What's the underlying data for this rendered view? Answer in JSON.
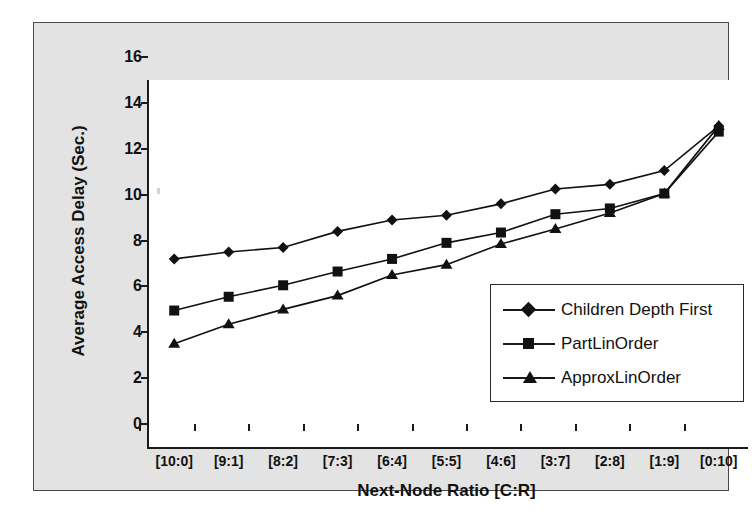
{
  "chart_data": {
    "type": "line",
    "title": "",
    "xlabel": "Next-Node Ratio [C:R]",
    "ylabel": "Average Access Delay (Sec.)",
    "categories": [
      "[10:0]",
      "[9:1]",
      "[8:2]",
      "[7:3]",
      "[6:4]",
      "[5:5]",
      "[4:6]",
      "[3:7]",
      "[2:8]",
      "[1:9]",
      "[0:10]"
    ],
    "yticks": [
      0,
      2,
      4,
      6,
      8,
      10,
      12,
      14,
      16
    ],
    "ylim": [
      0,
      16
    ],
    "grid": false,
    "legend_position": "inside-lower-right",
    "series": [
      {
        "name": "Children Depth First",
        "marker": "diamond",
        "color": "#111111",
        "values": [
          8.2,
          8.5,
          8.7,
          9.4,
          9.9,
          10.1,
          10.6,
          11.25,
          11.45,
          12.05,
          14.0
        ]
      },
      {
        "name": "PartLinOrder",
        "marker": "square",
        "color": "#111111",
        "values": [
          5.95,
          6.55,
          7.05,
          7.65,
          8.2,
          8.9,
          9.35,
          10.15,
          10.4,
          11.05,
          13.75
        ]
      },
      {
        "name": "ApproxLinOrder",
        "marker": "triangle",
        "color": "#111111",
        "values": [
          4.5,
          5.35,
          6.0,
          6.6,
          7.5,
          7.95,
          8.85,
          9.5,
          10.2,
          11.05,
          14.0
        ]
      }
    ]
  },
  "legend": {
    "items": [
      {
        "label": "Children Depth First",
        "marker": "diamond"
      },
      {
        "label": "PartLinOrder",
        "marker": "square"
      },
      {
        "label": "ApproxLinOrder",
        "marker": "triangle"
      }
    ]
  },
  "colors": {
    "plate_background": "#e3e3e3",
    "plot_background": "#ffffff",
    "axis": "#1a1a1a",
    "ink": "#111111"
  }
}
